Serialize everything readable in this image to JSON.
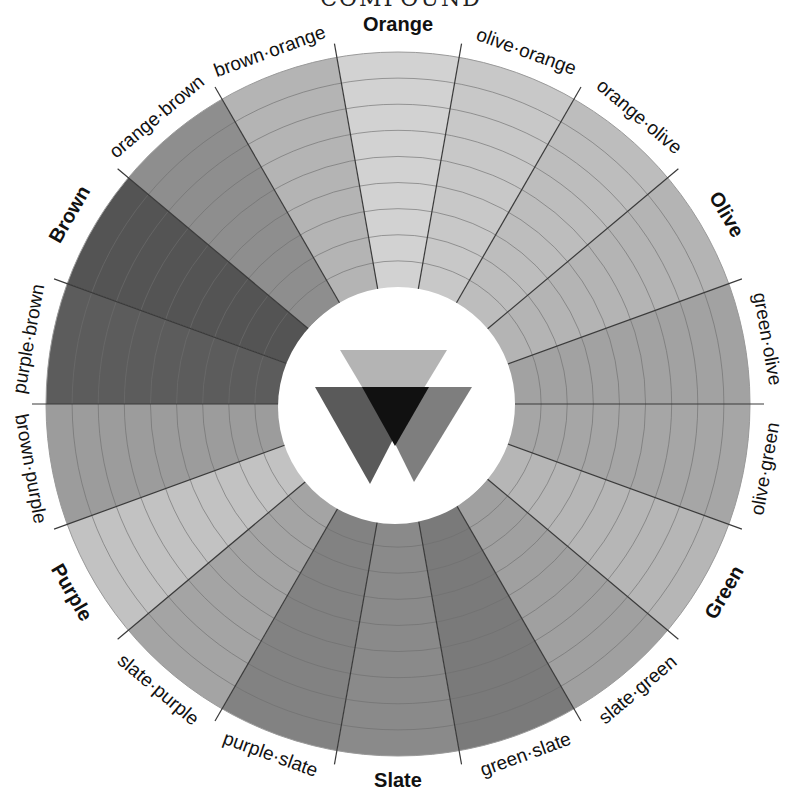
{
  "title": "COMPOUND",
  "wheel": {
    "center": [
      398,
      404
    ],
    "outer_radius": 352,
    "inner_radius": 117,
    "ring_count": 9,
    "segments": [
      {
        "label": "Orange",
        "primary": true,
        "shade": "#d2d2d2"
      },
      {
        "label": "olive·orange",
        "primary": false,
        "shade": "#c8c8c8"
      },
      {
        "label": "orange·olive",
        "primary": false,
        "shade": "#bdbdbd"
      },
      {
        "label": "Olive",
        "primary": true,
        "shade": "#b4b4b4"
      },
      {
        "label": "green·olive",
        "primary": false,
        "shade": "#a2a2a2"
      },
      {
        "label": "olive·green",
        "primary": false,
        "shade": "#a6a6a6"
      },
      {
        "label": "Green",
        "primary": true,
        "shade": "#b6b6b6"
      },
      {
        "label": "slate·green",
        "primary": false,
        "shade": "#a0a0a0"
      },
      {
        "label": "green·slate",
        "primary": false,
        "shade": "#7a7a7a"
      },
      {
        "label": "Slate",
        "primary": true,
        "shade": "#8a8a8a"
      },
      {
        "label": "purple·slate",
        "primary": false,
        "shade": "#828282"
      },
      {
        "label": "slate·purple",
        "primary": false,
        "shade": "#a4a4a4"
      },
      {
        "label": "Purple",
        "primary": true,
        "shade": "#c2c2c2"
      },
      {
        "label": "brown·purple",
        "primary": false,
        "shade": "#9c9c9c"
      },
      {
        "label": "purple·brown",
        "primary": false,
        "shade": "#5c5c5c"
      },
      {
        "label": "Brown",
        "primary": true,
        "shade": "#545454"
      },
      {
        "label": "orange·brown",
        "primary": false,
        "shade": "#8e8e8e"
      },
      {
        "label": "brown·orange",
        "primary": false,
        "shade": "#b4b4b4"
      }
    ]
  },
  "triangles": {
    "top": {
      "name": "light-triangle",
      "shade": "#b0b0b0"
    },
    "left": {
      "name": "dark-triangle",
      "shade": "#5a5a5a"
    },
    "right": {
      "name": "mid-triangle",
      "shade": "#7e7e7e"
    },
    "overlap": {
      "name": "overlap-triangle",
      "shade": "#111111"
    }
  }
}
